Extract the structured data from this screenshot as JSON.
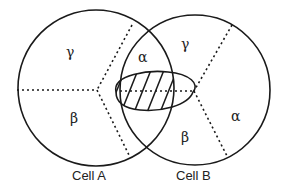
{
  "diagram": {
    "title": "",
    "cells": [
      {
        "name": "Cell A",
        "regions": [
          {
            "label": "γ"
          },
          {
            "label": "β"
          },
          {
            "label": "α"
          }
        ]
      },
      {
        "name": "Cell B",
        "regions": [
          {
            "label": "γ"
          },
          {
            "label": "α"
          },
          {
            "label": "β"
          }
        ]
      }
    ],
    "shared_region": {
      "description": "hatched overlap region"
    }
  }
}
